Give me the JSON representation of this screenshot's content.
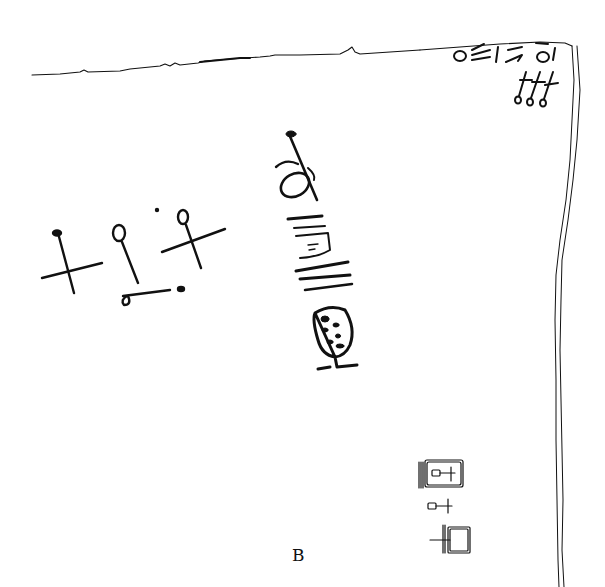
{
  "plate": {
    "label": "B",
    "stroke_color": "#111111",
    "background": "#ffffff"
  },
  "groups": [
    {
      "name": "top-right-inscription",
      "description": "horizontal hieroglyph row with three ankh-like signs below"
    },
    {
      "name": "central-column",
      "description": "vertical column: sign, water lines, basket, jar on stand"
    },
    {
      "name": "left-signs",
      "description": "three cross/ankh-like signs"
    },
    {
      "name": "bottom-right-signs",
      "description": "cartouche-like box with signs, small sign, box with cross"
    }
  ]
}
